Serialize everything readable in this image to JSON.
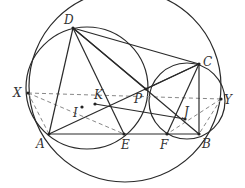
{
  "diagram": {
    "type": "geometry-figure",
    "points": {
      "D": {
        "label": "D",
        "x": 73,
        "y": 28
      },
      "C": {
        "label": "C",
        "x": 199,
        "y": 64
      },
      "A": {
        "label": "A",
        "x": 49,
        "y": 134
      },
      "B": {
        "label": "B",
        "x": 199,
        "y": 134
      },
      "E": {
        "label": "E",
        "x": 124,
        "y": 134
      },
      "F": {
        "label": "F",
        "x": 167,
        "y": 134
      },
      "P": {
        "label": "P",
        "x": 146,
        "y": 89
      },
      "X": {
        "label": "X",
        "x": 28,
        "y": 93
      },
      "Y": {
        "label": "Y",
        "x": 221,
        "y": 99
      },
      "K": {
        "label": "K",
        "x": 95,
        "y": 104
      },
      "I": {
        "label": "I",
        "x": 82,
        "y": 107
      },
      "J": {
        "label": "J",
        "x": 185,
        "y": 119
      }
    },
    "label_positions": {
      "D": {
        "x": 64,
        "y": 24
      },
      "C": {
        "x": 203,
        "y": 66
      },
      "A": {
        "x": 36,
        "y": 148
      },
      "B": {
        "x": 202,
        "y": 148
      },
      "E": {
        "x": 121,
        "y": 149
      },
      "F": {
        "x": 160,
        "y": 149
      },
      "P": {
        "x": 134,
        "y": 103
      },
      "X": {
        "x": 13,
        "y": 97
      },
      "Y": {
        "x": 224,
        "y": 104
      },
      "K": {
        "x": 94,
        "y": 99
      },
      "I": {
        "x": 73,
        "y": 117
      },
      "J": {
        "x": 184,
        "y": 116
      }
    },
    "circles": [
      {
        "name": "circumcircle",
        "cx": 125,
        "cy": 86,
        "r": 96
      },
      {
        "name": "circle-ADE",
        "cx": 87,
        "cy": 88,
        "r": 61
      },
      {
        "name": "circle-BCF",
        "cx": 187,
        "cy": 101,
        "r": 38
      }
    ],
    "solid_segments": [
      [
        "D",
        "C"
      ],
      [
        "A",
        "B"
      ],
      [
        "D",
        "A"
      ],
      [
        "D",
        "E"
      ],
      [
        "D",
        "P"
      ],
      [
        "D",
        "B"
      ],
      [
        "A",
        "C"
      ],
      [
        "C",
        "F"
      ],
      [
        "C",
        "B"
      ],
      [
        "C",
        "P"
      ],
      [
        "K",
        "J"
      ]
    ],
    "dashed_segments": [
      [
        "X",
        "Y"
      ],
      [
        "X",
        "A"
      ],
      [
        "X",
        "E"
      ],
      [
        "Y",
        "B"
      ],
      [
        "Y",
        "F"
      ]
    ]
  }
}
